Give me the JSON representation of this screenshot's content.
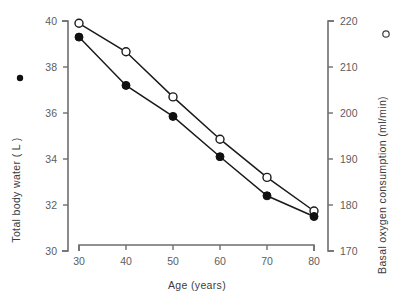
{
  "chart_data": {
    "type": "line",
    "title": "",
    "xlabel": "Age (years)",
    "ylabel": "Total body water ( L )",
    "y2label": "Basal oxygen consumption  (ml/min)",
    "grid": false,
    "legend_position": "axis-labels",
    "x": [
      30,
      40,
      50,
      60,
      70,
      80
    ],
    "xlim": [
      25,
      85
    ],
    "xticks": [
      "30",
      "40",
      "50",
      "60",
      "70",
      "80"
    ],
    "xtick_values": [
      30,
      40,
      50,
      60,
      70,
      80
    ],
    "ylim": [
      30,
      40
    ],
    "yticks": [
      "30",
      "32",
      "34",
      "36",
      "38",
      "40"
    ],
    "ytick_values": [
      30,
      32,
      34,
      36,
      38,
      40
    ],
    "y2lim": [
      170,
      220
    ],
    "y2ticks": [
      "170",
      "180",
      "190",
      "200",
      "210",
      "220"
    ],
    "y2tick_values": [
      170,
      180,
      190,
      200,
      210,
      220
    ],
    "series": [
      {
        "name": "Total body water ( L )",
        "axis": "left",
        "marker": "filled-circle",
        "units": "L",
        "values": [
          39.3,
          37.2,
          35.85,
          34.1,
          32.4,
          31.5
        ]
      },
      {
        "name": "Basal oxygen consumption (ml/min)",
        "axis": "right",
        "marker": "open-circle",
        "units": "ml/min",
        "values": [
          219.5,
          213.3,
          203.5,
          194.3,
          186.0,
          178.7
        ]
      }
    ],
    "annotations": []
  },
  "labels": {
    "x_axis_title": "Age (years)",
    "y_left_axis_title": "Total body water ( L )",
    "y_right_axis_title": "Basal oxygen consumption  (ml/min)",
    "legend_marker_left": "filled-circle",
    "legend_marker_right": "open-circle"
  },
  "colors": {
    "background": "#ffffff",
    "axis": "#6e6e6e",
    "tick_text": "#5d5d5d",
    "title_text": "#3c3c3c",
    "line": "#1a1a1a",
    "marker_filled": "#111111",
    "marker_open_fill": "#ffffff"
  }
}
